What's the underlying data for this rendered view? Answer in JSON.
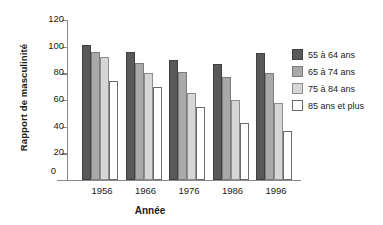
{
  "chart_data": {
    "type": "bar",
    "title": "",
    "xlabel": "Année",
    "ylabel": "Rapport de masculinité",
    "categories": [
      "1956",
      "1966",
      "1976",
      "1986",
      "1996"
    ],
    "series": [
      {
        "name": "55 à 64 ans",
        "color": "#595959",
        "values": [
          101,
          96,
          90,
          87,
          95
        ]
      },
      {
        "name": "65 à 74 ans",
        "color": "#a9a9a9",
        "values": [
          96,
          88,
          81,
          77,
          80
        ]
      },
      {
        "name": "75 à 84 ans",
        "color": "#d6d6d6",
        "values": [
          92,
          80,
          65,
          60,
          58
        ]
      },
      {
        "name": "85 ans et plus",
        "color": "#ffffff",
        "values": [
          74,
          70,
          55,
          43,
          37
        ]
      }
    ],
    "ylim": [
      0,
      120
    ],
    "yticks": [
      0,
      20,
      40,
      60,
      80,
      100,
      120
    ],
    "ytick_labels": [
      "0",
      "20",
      "40",
      "60",
      "80",
      "100",
      "120"
    ],
    "grid": false,
    "legend_position": "right",
    "axis_break": true,
    "zero_tick_label": "0"
  }
}
